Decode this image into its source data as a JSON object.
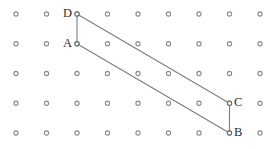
{
  "figure": {
    "canvas": {
      "width": 280,
      "height": 149,
      "background": "#ffffff"
    },
    "colors": {
      "dot_stroke": "#8a8a8a",
      "dot_fill": "#ffffff",
      "edge_stroke": "#7d7d7d",
      "label_text": "#2b2b2b"
    }
  },
  "grid": {
    "columns": 9,
    "rows": 5,
    "x_start": 16,
    "y_start": 14,
    "x_spacing": 30.5,
    "y_spacing": 29.75,
    "dot_radius": 2.1,
    "dot_inner_radius": 0.9
  },
  "vertices": [
    {
      "id": "D",
      "label": "D",
      "col": 2,
      "row": 0,
      "x": 77,
      "y": 14,
      "label_side": "left",
      "label_x": 63,
      "label_y": 7
    },
    {
      "id": "A",
      "label": "A",
      "col": 2,
      "row": 1,
      "x": 77,
      "y": 43.75,
      "label_side": "left",
      "label_x": 63,
      "label_y": 37
    },
    {
      "id": "C",
      "label": "C",
      "col": 7,
      "row": 3,
      "x": 229.5,
      "y": 103.25,
      "label_side": "right",
      "label_x": 234,
      "label_y": 96
    },
    {
      "id": "B",
      "label": "B",
      "col": 7,
      "row": 4,
      "x": 229.5,
      "y": 133,
      "label_side": "right",
      "label_x": 234,
      "label_y": 126
    }
  ],
  "edges": [
    {
      "id": "DA",
      "from": "D",
      "to": "A",
      "kind": "vertical"
    },
    {
      "id": "DC",
      "from": "D",
      "to": "C",
      "kind": "diagonal"
    },
    {
      "id": "AB",
      "from": "A",
      "to": "B",
      "kind": "diagonal"
    },
    {
      "id": "CB",
      "from": "C",
      "to": "B",
      "kind": "vertical"
    }
  ]
}
